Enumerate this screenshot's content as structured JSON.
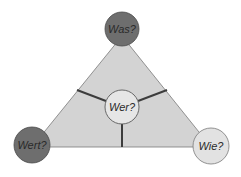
{
  "diagram": {
    "nodes": {
      "top": {
        "label": "Was?",
        "cx": 122,
        "cy": 29,
        "r": 17,
        "fill": "#6e6e6e"
      },
      "left": {
        "label": "Wert?",
        "cx": 32,
        "cy": 145,
        "r": 18,
        "fill": "#6e6e6e"
      },
      "right": {
        "label": "Wie?",
        "cx": 211,
        "cy": 146,
        "r": 18,
        "fill": "#e2e2e2"
      },
      "center": {
        "label": "Wer?",
        "cx": 122,
        "cy": 107,
        "r": 17,
        "fill": "#e6e6e6"
      }
    },
    "colors": {
      "triangle_fill": "#d3d3d3",
      "outline": "#7a7a7a",
      "divider": "#3c3c3c"
    }
  }
}
